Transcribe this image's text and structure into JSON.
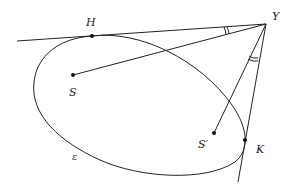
{
  "diagram": {
    "colors": {
      "line": "#222222",
      "point": "#111111",
      "background": "#ffffff"
    },
    "points": {
      "Y": {
        "label": "Y",
        "x": 266,
        "y": 24,
        "label_x": 272,
        "label_y": 20
      },
      "H": {
        "label": "H",
        "x": 92,
        "y": 36,
        "label_x": 86,
        "label_y": 26
      },
      "S": {
        "label": "S",
        "x": 73,
        "y": 75,
        "label_x": 69,
        "label_y": 96
      },
      "S_prime": {
        "label": "S′",
        "x": 214,
        "y": 133,
        "label_x": 198,
        "label_y": 148
      },
      "K": {
        "label": "K",
        "x": 245,
        "y": 140,
        "label_x": 256,
        "label_y": 153
      }
    },
    "curve_label": {
      "label": "ε",
      "x": 72,
      "y": 160
    },
    "segments": [
      {
        "name": "tangent-line-through-H",
        "from": [
          17,
          41
        ],
        "to": [
          266,
          24
        ]
      },
      {
        "name": "tangent-line-through-K",
        "from": [
          266,
          24
        ],
        "to": [
          238,
          182
        ]
      },
      {
        "name": "segment-S-Y",
        "from": [
          73,
          75
        ],
        "to": [
          266,
          24
        ]
      },
      {
        "name": "segment-Sprime-Y",
        "from": [
          214,
          133
        ],
        "to": [
          266,
          24
        ]
      }
    ],
    "angle_marks": [
      {
        "name": "angle-mark-HY-SY",
        "type": "double-arc"
      },
      {
        "name": "angle-mark-KY-SprimeY",
        "type": "double-arc"
      }
    ]
  }
}
